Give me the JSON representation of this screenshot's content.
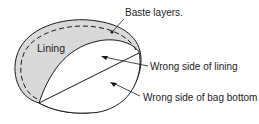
{
  "diagram": {
    "labels": {
      "lining": "Lining",
      "baste_layers": "Baste layers.",
      "wrong_side_lining": "Wrong side of lining",
      "wrong_side_bag_bottom": "Wrong side of bag bottom"
    },
    "colors": {
      "stroke": "#1a1a1a",
      "lining_fill": "#d9d9d9",
      "inner_fill": "#ffffff",
      "text": "#222222"
    }
  }
}
